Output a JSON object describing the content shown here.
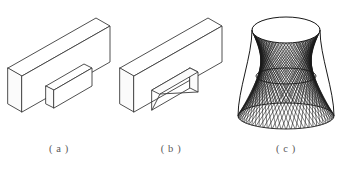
{
  "figure": {
    "title": "",
    "background_color": "#ffffff",
    "line_color": "#3c3c3c",
    "caption_color": "#5a5a5a",
    "panel_count": 3
  },
  "panels": [
    {
      "id": "a",
      "caption": "( a )",
      "object_name": "rectangular plate with protruding rectangular boss",
      "projection": "isometric",
      "features": [
        "flat rectangular plate",
        "raised rectangular block on front face"
      ]
    },
    {
      "id": "b",
      "caption": "( b )",
      "object_name": "rectangular plate with rectangular through-hole",
      "projection": "isometric",
      "features": [
        "flat rectangular plate",
        "rectangular through opening",
        "visible inner side walls"
      ]
    },
    {
      "id": "c",
      "caption": "( c )",
      "object_name": "hyperboloid of one sheet as ruled surface",
      "projection": "isometric",
      "features": [
        "top circular rim ellipse",
        "waist ellipse",
        "flared base ellipse",
        "straight line rulings"
      ],
      "ruling_count": 64
    }
  ],
  "chart_data": {
    "type": "diagram",
    "title": "",
    "items": [
      {
        "label": "( a )",
        "description": "plate with protruding rectangular boss"
      },
      {
        "label": "( b )",
        "description": "plate with rectangular through-hole"
      },
      {
        "label": "( c )",
        "description": "hyperboloid of one sheet, ruled by straight lines"
      }
    ]
  }
}
